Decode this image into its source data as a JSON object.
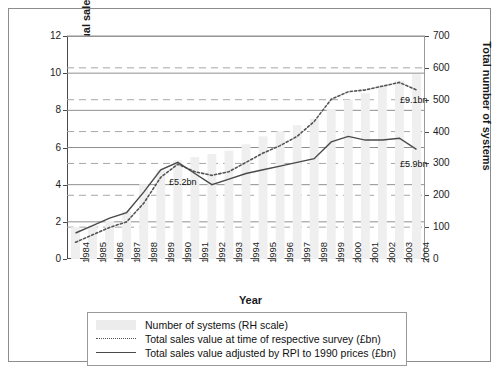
{
  "figure": {
    "outer_border_color": "#8d8d8d",
    "background": "#ffffff"
  },
  "axes": {
    "left_title": "Combined unit outlet annual sales turnover (£bn)",
    "right_title": "Total number of systems",
    "x_title": "Year"
  },
  "annotations": [
    {
      "name": "annot-5-2bn",
      "text": "£5.2bn",
      "x": 160,
      "y": 168
    },
    {
      "name": "annot-9-1bn",
      "text": "£9.1bn",
      "x": 391,
      "y": 86
    },
    {
      "name": "annot-5-9bn",
      "text": "£5.9bn",
      "x": 391,
      "y": 150
    }
  ],
  "legend": {
    "items": [
      {
        "key": "bar",
        "label": "Number of systems (RH scale)"
      },
      {
        "key": "dotted",
        "label": "Total sales value at time of respective survey (£bn)"
      },
      {
        "key": "solid",
        "label": "Total sales value adjusted by RPI to 1990 prices (£bn)"
      }
    ]
  },
  "chart_data": {
    "type": "bar",
    "title": "",
    "xlabel": "Year",
    "ylabel": "Combined unit outlet annual sales turnover (£bn)",
    "y2label": "Total number of systems",
    "categories": [
      "1984",
      "1985",
      "1986",
      "1987",
      "1988",
      "1989",
      "1990",
      "1991",
      "1992",
      "1993",
      "1994",
      "1995",
      "1996",
      "1997",
      "1998",
      "1999",
      "2000",
      "2001",
      "2002",
      "2003",
      "2004"
    ],
    "ylim": [
      0,
      12
    ],
    "yticks": [
      0,
      2,
      4,
      6,
      8,
      10,
      12
    ],
    "y2lim": [
      0,
      700
    ],
    "y2ticks": [
      0,
      100,
      200,
      300,
      400,
      500,
      600,
      700
    ],
    "grid": true,
    "legend_position": "bottom",
    "series": [
      {
        "name": "Number of systems (RH scale)",
        "type": "bar",
        "axis": "right",
        "color": "#efefef",
        "values": [
          100,
          105,
          120,
          150,
          235,
          280,
          310,
          320,
          330,
          340,
          360,
          385,
          400,
          420,
          440,
          470,
          500,
          520,
          545,
          560,
          580
        ]
      },
      {
        "name": "Total sales value at time of respective survey (£bn)",
        "type": "line",
        "style": "dotted",
        "axis": "left",
        "color": "#555555",
        "values": [
          0.9,
          1.3,
          1.7,
          2.0,
          3.0,
          4.4,
          5.1,
          4.7,
          4.5,
          4.7,
          5.2,
          5.7,
          6.1,
          6.6,
          7.4,
          8.6,
          9.0,
          9.1,
          9.3,
          9.5,
          9.1
        ]
      },
      {
        "name": "Total sales value adjusted by RPI to 1990 prices (£bn)",
        "type": "line",
        "style": "solid",
        "axis": "left",
        "color": "#4a4a4a",
        "values": [
          1.4,
          1.8,
          2.2,
          2.5,
          3.6,
          4.8,
          5.2,
          4.6,
          4.0,
          4.3,
          4.6,
          4.8,
          5.0,
          5.2,
          5.4,
          6.3,
          6.6,
          6.4,
          6.4,
          6.5,
          5.9
        ]
      }
    ]
  }
}
